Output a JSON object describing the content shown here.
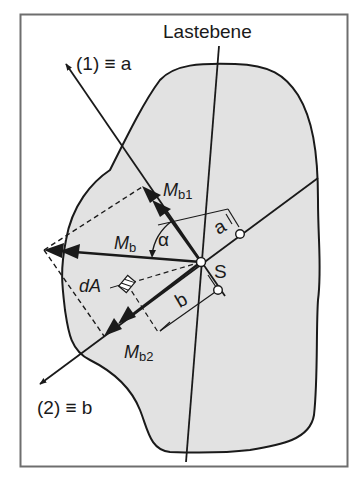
{
  "figure": {
    "title_label": "Lastebene",
    "axis1_label": "(1) ≡ a",
    "axis2_label": "(2) ≡ b",
    "centroid_label": "S",
    "moment_label": "M",
    "moment_sub": "b",
    "moment1_label": "M",
    "moment1_sub": "b1",
    "moment2_label": "M",
    "moment2_sub": "b2",
    "angle_label": "α",
    "area_element_label": "dA",
    "dim_a_label": "a",
    "dim_b_label": "b"
  },
  "colors": {
    "frame": "#6e6e6e",
    "section_fill": "#e2e2e2",
    "line": "#1a1a1a",
    "background": "#ffffff"
  }
}
